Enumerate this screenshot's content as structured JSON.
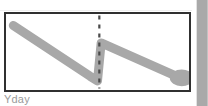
{
  "panel": {
    "border_color": "#303030",
    "background_color": "#ffffff"
  },
  "axis": {
    "x_label": "Yday",
    "label_color": "#9a9a9a"
  },
  "marker": {
    "end_point_shape": "round-blob",
    "color": "#a8a8a8"
  },
  "divider": {
    "style": "dotted",
    "color": "#4a4a4a",
    "orientation": "vertical"
  },
  "right_strip": {
    "color": "#a9a9a9"
  },
  "chart_data": {
    "type": "line",
    "title": "",
    "subtitle": "",
    "xlabel": "Yday",
    "ylabel": "",
    "style": "hand-drawn sketch",
    "grid": false,
    "legend": null,
    "stroke_color": "#a8a8a8",
    "stroke_width": 9,
    "xlim": [
      0,
      100
    ],
    "ylim": [
      0,
      100
    ],
    "x": [
      4,
      46,
      50,
      52,
      97
    ],
    "values": [
      85,
      18,
      12,
      62,
      14
    ],
    "series": [
      {
        "name": "trend",
        "x": [
          4,
          46,
          50,
          52,
          97
        ],
        "values": [
          85,
          18,
          12,
          62,
          14
        ]
      }
    ],
    "annotations": [
      {
        "type": "vertical-dotted-line",
        "x": 51,
        "label": "",
        "color": "#4a4a4a"
      },
      {
        "type": "end-marker",
        "x": 97,
        "y": 14,
        "shape": "round-blob",
        "color": "#a8a8a8"
      }
    ],
    "tick_labels": {
      "x": [
        "Yday"
      ],
      "y": []
    }
  }
}
